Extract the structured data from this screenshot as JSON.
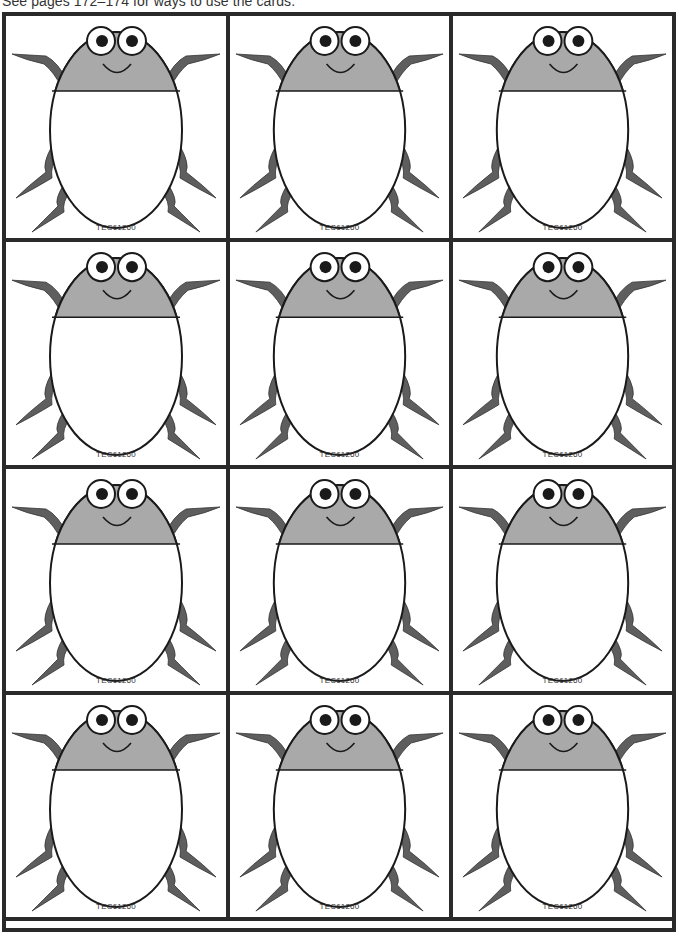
{
  "instruction": "See pages 172–174 for ways to use the cards.",
  "colors": {
    "border": "#2a2a2a",
    "head": "#a9a9a9",
    "legs": "#5e5e5e",
    "outline": "#1a1a1a",
    "body": "#ffffff"
  },
  "cards": [
    {
      "code": "TEC61260"
    },
    {
      "code": "TEC61260"
    },
    {
      "code": "TEC61260"
    },
    {
      "code": "TEC61260"
    },
    {
      "code": "TEC61260"
    },
    {
      "code": "TEC61260"
    },
    {
      "code": "TEC61260"
    },
    {
      "code": "TEC61260"
    },
    {
      "code": "TEC61260"
    },
    {
      "code": "TEC61260"
    },
    {
      "code": "TEC61260"
    },
    {
      "code": "TEC61260"
    }
  ]
}
